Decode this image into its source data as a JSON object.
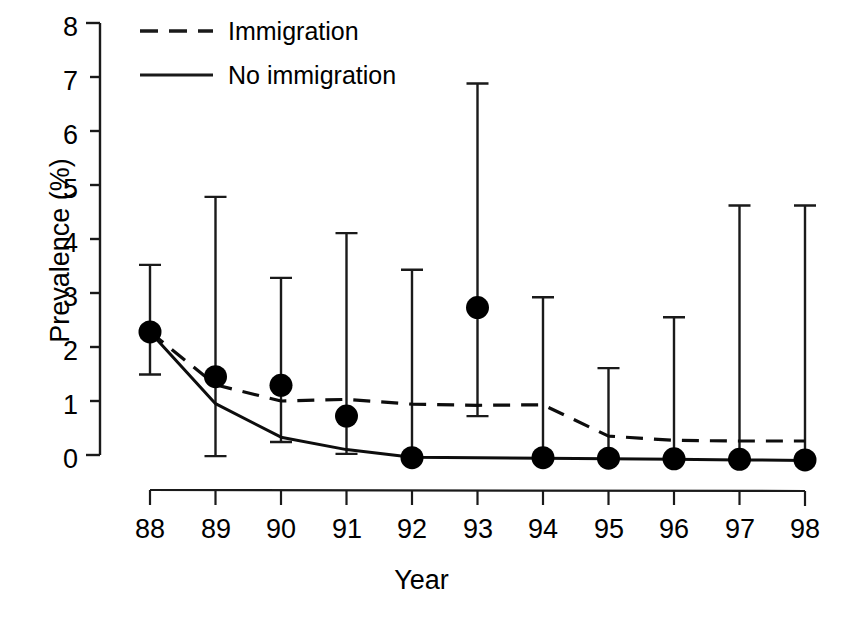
{
  "chart_data": {
    "type": "line",
    "title": "",
    "xlabel": "Year",
    "ylabel": "Prevalence (%)",
    "x": [
      "88",
      "89",
      "90",
      "91",
      "92",
      "93",
      "94",
      "95",
      "96",
      "97",
      "98"
    ],
    "xtick_labels": [
      "88",
      "89",
      "90",
      "91",
      "92",
      "93",
      "94",
      "95",
      "96",
      "97",
      "98"
    ],
    "ytick_labels": [
      "0",
      "1",
      "2",
      "3",
      "4",
      "5",
      "6",
      "7",
      "8"
    ],
    "ylim": [
      0,
      8
    ],
    "grid": false,
    "legend_position": "top-center",
    "series": [
      {
        "name": "Immigration",
        "style": "dashed",
        "marker": "none",
        "values": [
          2.28,
          1.3,
          1.0,
          1.03,
          0.94,
          0.92,
          0.93,
          0.35,
          0.27,
          0.26,
          0.26
        ]
      },
      {
        "name": "No immigration",
        "style": "solid",
        "marker": "none",
        "values": [
          2.28,
          0.95,
          0.33,
          0.1,
          -0.04,
          -0.05,
          -0.06,
          -0.07,
          -0.08,
          -0.09,
          -0.1
        ]
      },
      {
        "name": "Observed prevalence",
        "style": "points",
        "marker": "filled-circle",
        "values": [
          2.28,
          1.45,
          1.29,
          0.72,
          -0.05,
          2.73,
          -0.05,
          -0.06,
          -0.07,
          -0.08,
          -0.09
        ],
        "error_upper": [
          3.52,
          4.78,
          3.28,
          4.11,
          3.43,
          6.88,
          2.92,
          1.61,
          2.55,
          4.62,
          4.62
        ],
        "error_lower": [
          1.49,
          -0.02,
          0.24,
          0.02,
          -0.05,
          0.72,
          -0.05,
          -0.06,
          -0.07,
          -0.08,
          -0.09
        ]
      }
    ],
    "legend": [
      {
        "label": "Immigration",
        "style": "dashed"
      },
      {
        "label": "No immigration",
        "style": "solid"
      }
    ]
  }
}
